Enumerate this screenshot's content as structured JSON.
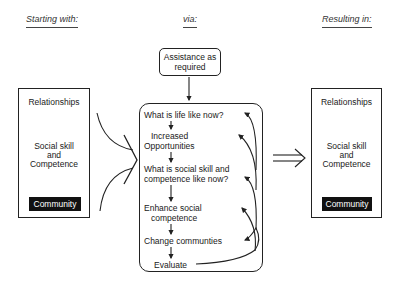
{
  "headers": {
    "starting": "Starting with:",
    "via": "via:",
    "resulting": "Resulting in:"
  },
  "assistance": {
    "line1": "Assistance as",
    "line2": "required"
  },
  "left_box": {
    "relationships": "Relationships",
    "skill_line1": "Social skill",
    "skill_line2": "and",
    "skill_line3": "Competence",
    "community": "Community"
  },
  "right_box": {
    "relationships": "Relationships",
    "skill_line1": "Social skill",
    "skill_line2": "and",
    "skill_line3": "Competence",
    "community": "Community"
  },
  "process": {
    "steps": [
      {
        "line1": "What is life like now?"
      },
      {
        "line1": "Increased",
        "line2": "Opportunities"
      },
      {
        "line1": "What is social skill and",
        "line2": "competence like now?"
      },
      {
        "line1": "Enhance social",
        "line2": "competence"
      },
      {
        "line1": "Change communties"
      },
      {
        "line1": "Evaluate"
      }
    ]
  },
  "icons": {
    "funnel": "chevron-right-funnel",
    "result_arrow": "double-arrow-right"
  }
}
